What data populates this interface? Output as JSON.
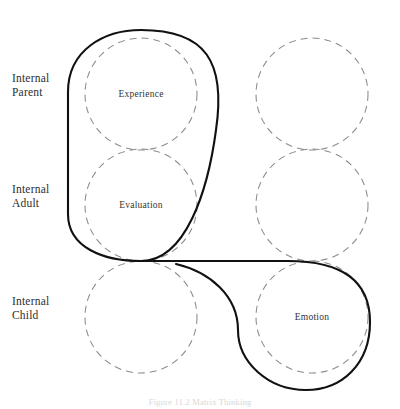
{
  "figure": {
    "caption": "Figure 11.2    Matrix Thinking",
    "folio": "",
    "colors": {
      "circle_stroke": "#8a8a8a",
      "path_stroke": "#111111",
      "background": "#ffffff",
      "text": "#2e2e2e"
    }
  },
  "row_labels": [
    {
      "id": "parent",
      "line1": "Internal",
      "line2": "Parent",
      "text": "Internal\nParent"
    },
    {
      "id": "adult",
      "line1": "Internal",
      "line2": "Adult",
      "text": "Internal\nAdult"
    },
    {
      "id": "child",
      "line1": "Internal",
      "line2": "Child",
      "text": "Internal\nChild"
    }
  ],
  "nodes": [
    {
      "id": "left-parent",
      "label": "Experience",
      "column": "left",
      "row": "parent",
      "cx": 141,
      "cy": 94,
      "r": 56,
      "labeled": true
    },
    {
      "id": "left-adult",
      "label": "Evaluation",
      "column": "left",
      "row": "adult",
      "cx": 141,
      "cy": 205,
      "r": 56,
      "labeled": true
    },
    {
      "id": "left-child",
      "label": "",
      "column": "left",
      "row": "child",
      "cx": 141,
      "cy": 317,
      "r": 56,
      "labeled": false
    },
    {
      "id": "right-parent",
      "label": "",
      "column": "right",
      "row": "parent",
      "cx": 312,
      "cy": 94,
      "r": 56,
      "labeled": false
    },
    {
      "id": "right-adult",
      "label": "",
      "column": "right",
      "row": "adult",
      "cx": 312,
      "cy": 205,
      "r": 56,
      "labeled": false
    },
    {
      "id": "right-child",
      "label": "Emotion",
      "column": "right",
      "row": "child",
      "cx": 312,
      "cy": 317,
      "r": 56,
      "labeled": true
    }
  ],
  "flow_path": {
    "id": "matrix-flow-path",
    "description": "Continuous S-shaped loop enclosing Experience and Evaluation, descending diagonally, then looping around Emotion",
    "stroke_width": 2.1,
    "d": "M 141 30 C 104 30, 68 50, 68 92 L 68 214 C 68 248, 104 261, 141 261 C 186 261, 208 190, 216 130 C 226 62, 206 30, 141 30 M 141 261 C 198 261, 236 261, 288 261 C 340 261, 370 280, 370 322 C 370 364, 342 390, 306 390 C 268 390, 238 362, 238 330 C 238 296, 210 272, 176 264"
  },
  "geometry": {
    "canvas_width": 400,
    "canvas_height": 409,
    "column_x": {
      "left": 141,
      "right": 312
    },
    "row_y": {
      "parent": 94,
      "adult": 205,
      "child": 317
    },
    "circle_radius": 56,
    "dash_pattern": "7 5"
  }
}
